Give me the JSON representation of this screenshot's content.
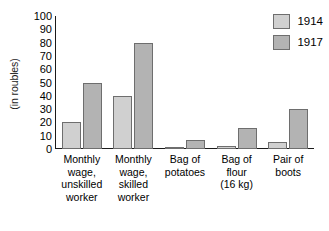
{
  "chart_data": {
    "type": "bar",
    "title": "",
    "xlabel": "",
    "ylabel": "(in roubles)",
    "ylim": [
      0,
      100
    ],
    "yticks": [
      100,
      90,
      80,
      70,
      60,
      50,
      40,
      30,
      20,
      10,
      0
    ],
    "grid": false,
    "legend_position": "top-right",
    "categories": [
      "Monthly\nwage,\nunskilled\nworker",
      "Monthly\nwage,\nskilled\nworker",
      "Bag of\npotatoes",
      "Bag of\nflour\n(16 kg)",
      "Pair of\nboots"
    ],
    "category_lines": [
      [
        "Monthly",
        "wage,",
        "unskilled",
        "worker"
      ],
      [
        "Monthly",
        "wage,",
        "skilled",
        "worker"
      ],
      [
        "Bag of",
        "potatoes"
      ],
      [
        "Bag of",
        "flour",
        "(16 kg)"
      ],
      [
        "Pair of",
        "boots"
      ]
    ],
    "series": [
      {
        "name": "1914",
        "color": "#d0d0d0",
        "values": [
          20,
          40,
          1,
          2,
          5
        ]
      },
      {
        "name": "1917",
        "color": "#b3b3b3",
        "values": [
          50,
          80,
          7,
          16,
          30
        ]
      }
    ]
  },
  "legend": {
    "items": [
      {
        "label": "1914"
      },
      {
        "label": "1917"
      }
    ]
  }
}
